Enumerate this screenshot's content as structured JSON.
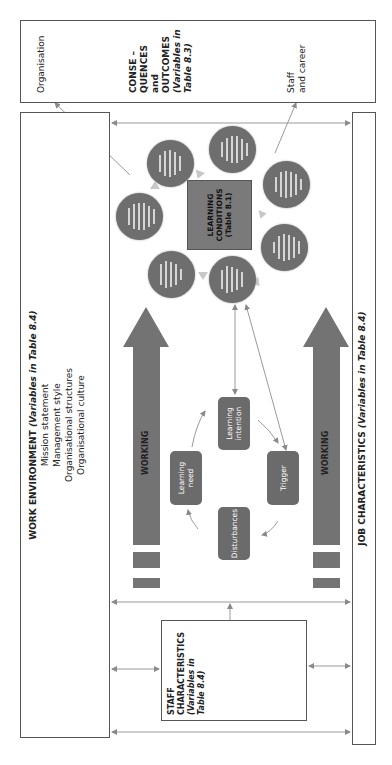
{
  "outcomes": {
    "title_lines": [
      "CONSE –",
      "QUENCES",
      "and",
      "OUTCOMES"
    ],
    "subtitle_lines": [
      "(Variables in",
      "Table 8.3)"
    ],
    "organisation_label": "Organisation",
    "staff_career_lines": [
      "Staff",
      "and career"
    ]
  },
  "work_environment": {
    "title": "WORK ENVIRONMENT ",
    "title_italic": "(Variables in Table 8.4)",
    "items": [
      "Mission statement",
      "Management style",
      "Organisational structures",
      "Organisational culture"
    ]
  },
  "job_characteristics": {
    "title": "JOB CHARACTERISTICS ",
    "title_italic": "(Variables in Table 8.4)"
  },
  "staff_characteristics": {
    "title_lines": [
      "STAFF",
      "CHARACTERISTICS"
    ],
    "subtitle_lines": [
      "(Variables in",
      "Table 8.4)"
    ]
  },
  "learning_conditions": {
    "lines": [
      "LEARNING",
      "CONDITIONS",
      "(Table 8.1)"
    ]
  },
  "working_arrows": [
    "WORKING",
    "WORKING"
  ],
  "cycle": {
    "learning_intention": [
      "Learning",
      "intention"
    ],
    "learning_need": [
      "Learning",
      "need"
    ],
    "trigger": [
      "Trigger"
    ],
    "disturbances": [
      "Disturbances"
    ]
  },
  "condition_circles": [
    {
      "text": "",
      "lines": 5
    },
    {
      "text": "",
      "lines": 6
    },
    {
      "text": "",
      "lines": 6
    },
    {
      "text": "",
      "lines": 6
    },
    {
      "text": "",
      "lines": 5
    },
    {
      "text": "",
      "lines": 5
    },
    {
      "text": "",
      "lines": 6
    }
  ],
  "colors": {
    "fill_dark": "#6e6e6e",
    "square_fill": "#7a7a7a",
    "line": "#8a8a8a",
    "border": "#555555"
  }
}
